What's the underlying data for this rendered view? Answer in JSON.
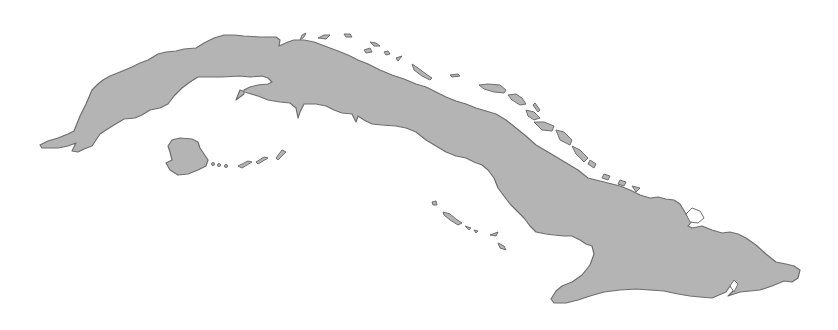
{
  "map": {
    "subject": "Cuba",
    "style": "grayscale silhouette",
    "land_color": "#b4b4b4",
    "outline_color": "#6e6e6e",
    "background_color": "#ffffff",
    "features": [
      {
        "name": "main-island",
        "type": "landmass"
      },
      {
        "name": "isla-de-la-juventud",
        "type": "island"
      },
      {
        "name": "canarreos-archipelago",
        "type": "islets"
      },
      {
        "name": "sabana-camaguey-archipelago",
        "type": "islets"
      },
      {
        "name": "jardines-de-la-reina",
        "type": "islets"
      }
    ]
  }
}
